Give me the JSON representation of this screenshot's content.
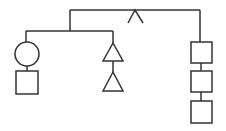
{
  "diagram": {
    "type": "tree",
    "stroke_color": "#333333",
    "background": "#ffffff",
    "root": {
      "marker": "caret",
      "children": [
        {
          "name": "left-group",
          "children": [
            {
              "name": "left-branch",
              "nodes": [
                "circle",
                "square"
              ]
            },
            {
              "name": "middle-branch",
              "nodes": [
                "triangle",
                "triangle"
              ]
            }
          ]
        },
        {
          "name": "right-branch",
          "nodes": [
            "square",
            "square",
            "square"
          ]
        }
      ]
    }
  }
}
